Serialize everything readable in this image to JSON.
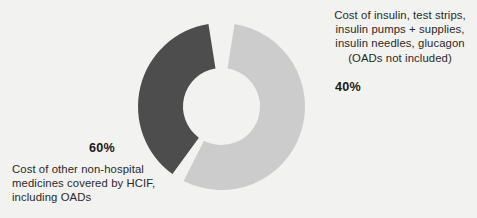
{
  "chart_data": {
    "type": "pie",
    "variant": "donut",
    "title": "",
    "subtitle": "",
    "xlabel": "",
    "ylabel": "",
    "legend_position": "callouts",
    "grid": false,
    "center_x": 221.5,
    "center_y": 106.5,
    "outer_radius": 83.5,
    "inner_radius": 38.5,
    "gap_degrees": 9,
    "categories": [
      "Cost of other non-hospital medicines covered by HCIF, including OADs",
      "Cost of insulin, test strips, insulin pumps + supplies, insulin needles, glucagon (OADs not included)"
    ],
    "values": [
      60,
      40
    ],
    "value_labels": [
      "60%",
      "40%"
    ],
    "colors": [
      "#4d4d4d",
      "#cccccc"
    ],
    "slices": [
      {
        "label": "60%",
        "value": 60,
        "color": "#4d4d4d",
        "start_angle": 216,
        "end_angle": 351,
        "description": "Cost of other non-hospital medicines covered by HCIF, including OADs"
      },
      {
        "label": "40%",
        "value": 40,
        "color": "#cccccc",
        "start_angle": 9,
        "end_angle": 207,
        "description": "Cost of insulin, test strips, insulin pumps + supplies, insulin needles, glucagon (OADs not included)"
      }
    ]
  },
  "background_color": "#f2f2f0",
  "callouts": {
    "right": {
      "lines": [
        "Cost of insulin, test strips,",
        "insulin pumps + supplies,",
        "insulin needles, glucagon",
        "(OADs not included)"
      ],
      "percent": "40%"
    },
    "left": {
      "lines": [
        "Cost of other non-hospital",
        "medicines covered by HCIF,",
        "including OADs"
      ],
      "percent": "60%"
    }
  }
}
